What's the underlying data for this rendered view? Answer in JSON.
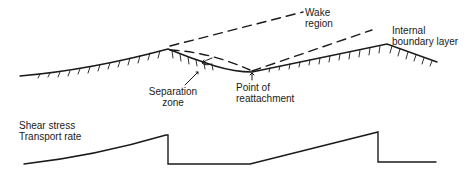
{
  "labels": {
    "wake_region": [
      "Wake",
      "region"
    ],
    "internal_boundary_layer": [
      "Internal",
      "boundary layer"
    ],
    "separation_zone": [
      "Separation",
      "zone"
    ],
    "point_of_reattachment": [
      "Point of",
      "reattachment"
    ],
    "y_axis": [
      "Shear stress",
      "Transport rate"
    ]
  },
  "colors": {
    "ink": "#1a1a1a",
    "background": "#ffffff"
  }
}
